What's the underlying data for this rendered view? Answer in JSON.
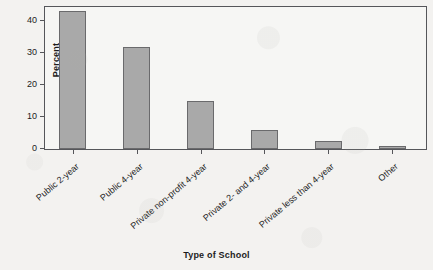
{
  "chart_data": {
    "type": "bar",
    "title": "",
    "xlabel": "Type of School",
    "ylabel": "Percent",
    "categories": [
      "Public 2-year",
      "Public 4-year",
      "Private non-profit 4-year",
      "Private 2- and 4-year",
      "Private less than 4-year",
      "Other"
    ],
    "values": [
      43,
      32,
      15,
      5.8,
      2.6,
      0.8
    ],
    "ylim": [
      0,
      45
    ],
    "yticks": [
      0,
      10,
      20,
      30,
      40
    ],
    "ytick_labels": [
      "0",
      "10",
      "20",
      "30",
      "40"
    ],
    "grid": false,
    "legend": false,
    "bar_color": "#a9a9a9",
    "bar_edge_color": "#6a6a6c",
    "axis_color": "#55565a",
    "background_color": "#f3f2f0"
  }
}
